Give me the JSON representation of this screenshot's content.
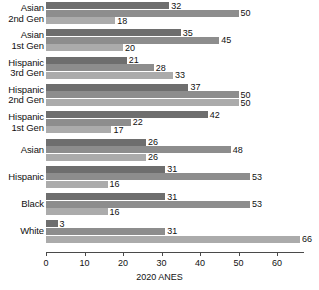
{
  "chart_data": {
    "type": "bar",
    "orientation": "horizontal",
    "title": "",
    "xlabel": "2020 ANES",
    "ylabel": "",
    "xlim": [
      0,
      67
    ],
    "xticks": [
      0,
      10,
      20,
      30,
      40,
      50,
      60
    ],
    "xticklabels": [
      "0",
      "10",
      "20",
      "30",
      "40",
      "50",
      "60"
    ],
    "grid": false,
    "legend": "none",
    "categories": [
      "Asian\n2nd Gen",
      "Asian\n1st Gen",
      "Hispanic\n3rd Gen",
      "Hispanic\n2nd Gen",
      "Hispanic\n1st Gen",
      "Asian",
      "Hispanic",
      "Black",
      "White"
    ],
    "series": [
      {
        "name": "series-1",
        "color": "#6e6e6e",
        "values": [
          32,
          35,
          21,
          37,
          42,
          26,
          31,
          31,
          3
        ]
      },
      {
        "name": "series-2",
        "color": "#8d8d8d",
        "values": [
          50,
          45,
          28,
          50,
          22,
          48,
          53,
          53,
          31
        ]
      },
      {
        "name": "series-3",
        "color": "#ababab",
        "values": [
          18,
          20,
          33,
          50,
          17,
          26,
          16,
          16,
          66
        ]
      }
    ]
  }
}
